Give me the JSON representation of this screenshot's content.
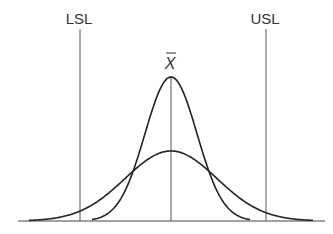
{
  "diagram": {
    "type": "process-capability",
    "labels": {
      "lsl": "LSL",
      "usl": "USL",
      "mean": "X"
    },
    "mean_has_overbar": true,
    "colors": {
      "line": "#333333",
      "spec_line": "#555555",
      "background": "#ffffff"
    },
    "curves": [
      {
        "name": "narrow-distribution",
        "description": "tall narrow normal curve centered on mean"
      },
      {
        "name": "wide-distribution",
        "description": "short wide normal curve centered on mean"
      }
    ]
  }
}
